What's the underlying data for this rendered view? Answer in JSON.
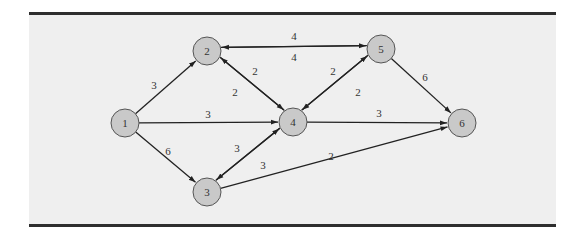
{
  "diagram": {
    "type": "directed-network",
    "colors": {
      "background": "#efefef",
      "page": "#ffffff",
      "rule": "#2e2e2e",
      "node_fill": "#c9c9c9",
      "node_stroke": "#555555",
      "edge": "#222222",
      "text": "#333333"
    },
    "nodes": [
      {
        "id": "1",
        "label": "1",
        "x": 125,
        "y": 123
      },
      {
        "id": "2",
        "label": "2",
        "x": 207,
        "y": 51
      },
      {
        "id": "3",
        "label": "3",
        "x": 207,
        "y": 192
      },
      {
        "id": "4",
        "label": "4",
        "x": 293,
        "y": 122
      },
      {
        "id": "5",
        "label": "5",
        "x": 381,
        "y": 49
      },
      {
        "id": "6",
        "label": "6",
        "x": 462,
        "y": 123
      }
    ],
    "edges": [
      {
        "from": "1",
        "to": "2",
        "weight": "3",
        "label_x": 154,
        "label_y": 89
      },
      {
        "from": "1",
        "to": "4",
        "weight": "3",
        "label_x": 208,
        "label_y": 118
      },
      {
        "from": "1",
        "to": "3",
        "weight": "6",
        "label_x": 168,
        "label_y": 155
      },
      {
        "from": "2",
        "to": "5",
        "weight": "4",
        "label_x": 294,
        "label_y": 40
      },
      {
        "from": "5",
        "to": "2",
        "weight": "4",
        "label_x": 294,
        "label_y": 61
      },
      {
        "from": "2",
        "to": "4",
        "weight": "2",
        "label_x": 235,
        "label_y": 96
      },
      {
        "from": "4",
        "to": "2",
        "weight": "2",
        "label_x": 255,
        "label_y": 75
      },
      {
        "from": "4",
        "to": "5",
        "weight": "2",
        "label_x": 358,
        "label_y": 96
      },
      {
        "from": "5",
        "to": "4",
        "weight": "2",
        "label_x": 333,
        "label_y": 75
      },
      {
        "from": "4",
        "to": "3",
        "weight": "3",
        "label_x": 237,
        "label_y": 152
      },
      {
        "from": "3",
        "to": "4",
        "weight": "3",
        "label_x": 263,
        "label_y": 169
      },
      {
        "from": "4",
        "to": "6",
        "weight": "3",
        "label_x": 379,
        "label_y": 117
      },
      {
        "from": "5",
        "to": "6",
        "weight": "6",
        "label_x": 425,
        "label_y": 81
      },
      {
        "from": "3",
        "to": "6",
        "weight": "2",
        "label_x": 331,
        "label_y": 160
      }
    ]
  }
}
